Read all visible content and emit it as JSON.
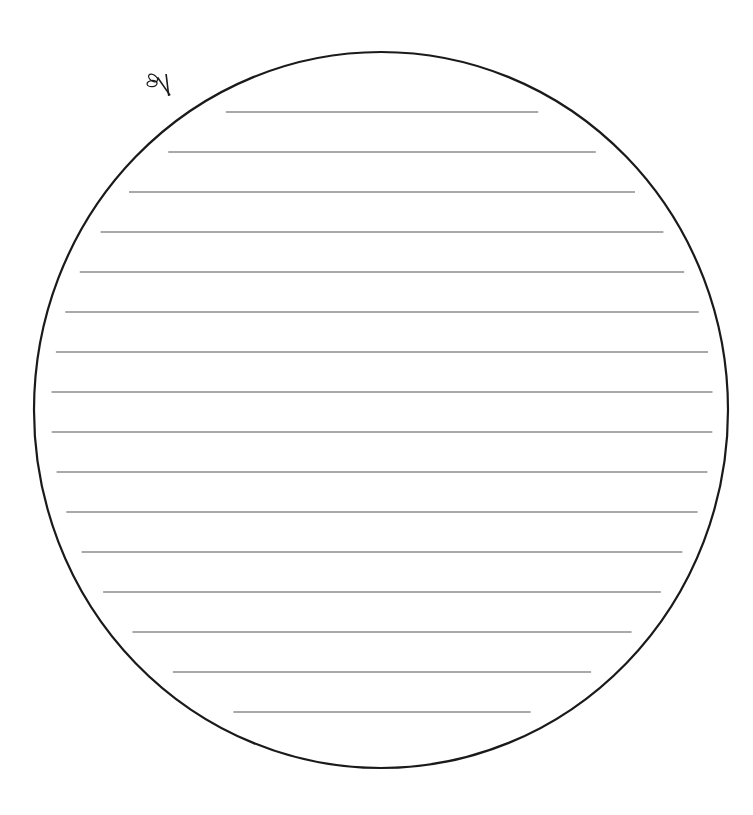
{
  "template": {
    "type": "circular-lined-writing-template",
    "line_count": 16,
    "cut_mark_icon": "scissors-icon",
    "outline_color": "#1a1a1a",
    "line_color": "#555555",
    "background_color": "#ffffff"
  }
}
